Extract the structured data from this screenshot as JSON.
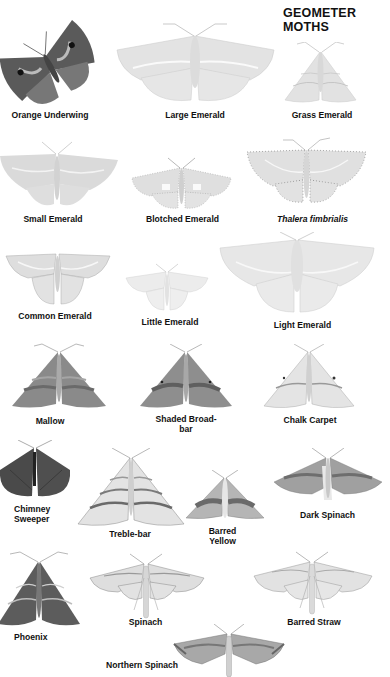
{
  "page": {
    "title": "GEOMETER MOTHS"
  },
  "moths": [
    {
      "name": "Orange Underwing",
      "style": "normal",
      "tone": "dark"
    },
    {
      "name": "Large Emerald",
      "style": "normal",
      "tone": "pale"
    },
    {
      "name": "Grass Emerald",
      "style": "normal",
      "tone": "pale"
    },
    {
      "name": "Small Emerald",
      "style": "normal",
      "tone": "pale"
    },
    {
      "name": "Blotched Emerald",
      "style": "normal",
      "tone": "pale"
    },
    {
      "name": "Thalera fimbrialis",
      "style": "italic",
      "tone": "pale"
    },
    {
      "name": "Common Emerald",
      "style": "normal",
      "tone": "pale"
    },
    {
      "name": "Little Emerald",
      "style": "normal",
      "tone": "pale"
    },
    {
      "name": "Light Emerald",
      "style": "normal",
      "tone": "pale"
    },
    {
      "name": "Mallow",
      "style": "normal",
      "tone": "mid"
    },
    {
      "name": "Shaded Broad-\nbar",
      "style": "normal",
      "tone": "mid"
    },
    {
      "name": "Chalk Carpet",
      "style": "normal",
      "tone": "light"
    },
    {
      "name": "Chimney\nSweeper",
      "style": "normal",
      "tone": "dark"
    },
    {
      "name": "Treble-bar",
      "style": "normal",
      "tone": "light"
    },
    {
      "name": "Barred\nYellow",
      "style": "normal",
      "tone": "mid"
    },
    {
      "name": "Dark Spinach",
      "style": "normal",
      "tone": "mid"
    },
    {
      "name": "Phoenix",
      "style": "normal",
      "tone": "dark"
    },
    {
      "name": "Spinach",
      "style": "normal",
      "tone": "light"
    },
    {
      "name": "Barred Straw",
      "style": "normal",
      "tone": "light"
    },
    {
      "name": "Northern Spinach",
      "style": "normal",
      "tone": "mid"
    }
  ],
  "colors": {
    "pale_wing": "#e4e4e4",
    "pale_line": "#f7f7f7",
    "mid_wing": "#8a8a8a",
    "dark_wing": "#4a4a4a",
    "label_text": "#111111"
  }
}
